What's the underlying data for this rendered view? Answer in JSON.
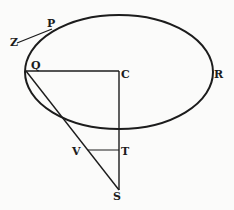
{
  "diagram": {
    "type": "geometric figure",
    "ellipse": {
      "cx": 119,
      "cy": 72,
      "rx": 94,
      "ry": 57
    },
    "labels": {
      "P": "P",
      "Z": "Z",
      "Q": "Q",
      "C": "C",
      "R": "R",
      "V": "V",
      "T": "T",
      "S": "S"
    },
    "points": {
      "Z": [
        17,
        42
      ],
      "P": [
        52,
        30
      ],
      "Q": [
        26,
        71
      ],
      "C": [
        119,
        71
      ],
      "R": [
        213,
        72
      ],
      "V": [
        88,
        150
      ],
      "T": [
        119,
        150
      ],
      "S": [
        119,
        190
      ]
    },
    "segments": [
      "ZP",
      "QC",
      "CS",
      "QS",
      "VT"
    ],
    "colors": {
      "ink": "#1c1c1c",
      "paper": "#fbfbfa"
    }
  }
}
